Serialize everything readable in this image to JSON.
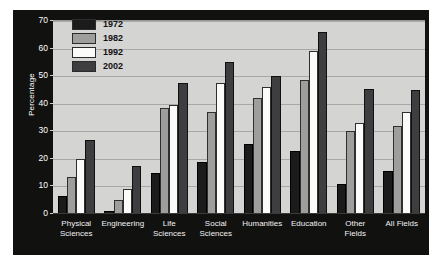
{
  "chart_data": {
    "type": "bar",
    "title": "",
    "xlabel": "",
    "ylabel": "Percentage",
    "ylim": [
      0,
      70
    ],
    "ytick_step": 10,
    "yticks": [
      0,
      10,
      20,
      30,
      40,
      50,
      60,
      70
    ],
    "grid": true,
    "legend_position": "top-left-inside",
    "categories": [
      "Physical Sciences",
      "Engineering",
      "Life Sciences",
      "Social Sciences",
      "Humanities",
      "Education",
      "Other Fields",
      "All Fields"
    ],
    "category_lines": [
      [
        "Physical",
        "Sciences"
      ],
      [
        "Engineering",
        ""
      ],
      [
        "Life",
        "Sciences"
      ],
      [
        "Social",
        "Sciences"
      ],
      [
        "Humanities",
        ""
      ],
      [
        "Education",
        ""
      ],
      [
        "Other",
        "Fields"
      ],
      [
        "All Fields",
        ""
      ]
    ],
    "series": [
      {
        "name": "1972",
        "color": "#1b1b1c",
        "values": [
          6.5,
          1.0,
          15.0,
          19.0,
          25.5,
          23.0,
          11.0,
          15.5
        ]
      },
      {
        "name": "1982",
        "color": "#9e9e9c",
        "values": [
          13.5,
          5.0,
          38.5,
          37.0,
          42.0,
          48.5,
          30.0,
          32.0
        ]
      },
      {
        "name": "1992",
        "color": "#fbfbf9",
        "values": [
          20.0,
          9.0,
          39.5,
          47.5,
          46.0,
          59.0,
          33.0,
          37.0
        ]
      },
      {
        "name": "2002",
        "color": "#3e3e40",
        "values": [
          27.0,
          17.5,
          47.5,
          55.0,
          50.0,
          66.0,
          45.5,
          45.0
        ]
      }
    ]
  },
  "legend": {
    "entries": [
      {
        "label": "1972",
        "swatch": "legend-swatch-1972"
      },
      {
        "label": "1982",
        "swatch": "legend-swatch-1982"
      },
      {
        "label": "1992",
        "swatch": "legend-swatch-1992"
      },
      {
        "label": "2002",
        "swatch": "legend-swatch-2002"
      }
    ]
  },
  "axis": {
    "y_title": "Percentage",
    "y_tick_labels": [
      "70",
      "60",
      "50",
      "40",
      "30",
      "20",
      "10",
      "0"
    ]
  },
  "colors": {
    "plot_background": "#d4d4d2",
    "frame": "#111110",
    "gridline": "#a8a8a6",
    "page_background": "#ffffff",
    "axis_text": "#ffffff"
  }
}
